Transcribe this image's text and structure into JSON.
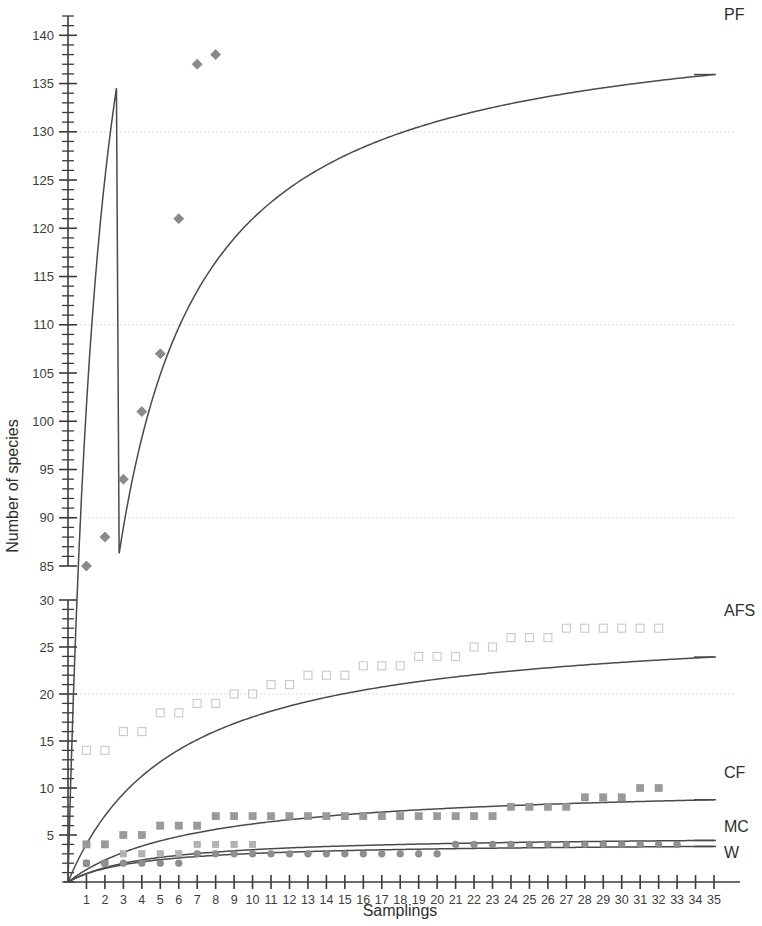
{
  "chart_data": {
    "type": "scatter",
    "title": "",
    "xlabel": "Samplings",
    "ylabel": "Number of species",
    "xlim": [
      0,
      35
    ],
    "xticks": [
      1,
      2,
      3,
      4,
      5,
      6,
      7,
      8,
      9,
      10,
      11,
      12,
      13,
      14,
      15,
      16,
      17,
      18,
      19,
      20,
      21,
      22,
      23,
      24,
      25,
      26,
      27,
      28,
      29,
      30,
      31,
      32,
      33,
      34,
      35
    ],
    "grid": "faint horizontal gridlines at 20, 90, 110, 130",
    "legend_position": "right of plot, at curve ends",
    "y_axis_broken": true,
    "y_axis_break_note": "Axis is broken between 30 and 85; lower segment spans 0-30, upper segment spans 85-140+",
    "y_lower_segment": {
      "range": [
        0,
        30
      ],
      "labeled_ticks": [
        5,
        10,
        15,
        20,
        25,
        30
      ],
      "minor_tick_step": 1
    },
    "y_upper_segment": {
      "range": [
        85,
        142
      ],
      "labeled_ticks": [
        85,
        90,
        95,
        100,
        105,
        110,
        115,
        120,
        125,
        130,
        135,
        140
      ],
      "minor_tick_step": 1
    },
    "series": [
      {
        "name": "PF",
        "label": "PF",
        "marker": "filled-diamond",
        "color": "#8a8a8a",
        "x": [
          1,
          2,
          3,
          4,
          5,
          6,
          7,
          8
        ],
        "values": [
          85,
          88,
          94,
          101,
          107,
          121,
          137,
          138
        ],
        "curve_asymptote": 143,
        "curve_note": "Michaelis-Menten style saturation curve rising from 0 to about 143 at sampling 35"
      },
      {
        "name": "AFS",
        "label": "AFS",
        "marker": "open-square",
        "color": "#c9c9c9",
        "x": [
          1,
          2,
          3,
          4,
          5,
          6,
          7,
          8,
          9,
          10,
          11,
          12,
          13,
          14,
          15,
          16,
          17,
          18,
          19,
          20,
          21,
          22,
          23,
          24,
          25,
          26,
          27,
          28,
          29,
          30,
          31,
          32
        ],
        "values": [
          14,
          14,
          16,
          16,
          18,
          18,
          19,
          19,
          20,
          20,
          21,
          21,
          22,
          22,
          22,
          23,
          23,
          23,
          24,
          24,
          24,
          25,
          25,
          26,
          26,
          26,
          27,
          27,
          27,
          27,
          27,
          27
        ],
        "curve_asymptote": 28,
        "curve_note": "Saturation curve rising to about 28 at sampling 35"
      },
      {
        "name": "CF",
        "label": "CF",
        "marker": "filled-square",
        "color": "#9a9a9a",
        "x": [
          1,
          2,
          3,
          4,
          5,
          6,
          7,
          8,
          9,
          10,
          11,
          12,
          13,
          14,
          15,
          16,
          17,
          18,
          19,
          20,
          21,
          22,
          23,
          24,
          25,
          26,
          27,
          28,
          29,
          30,
          31,
          32
        ],
        "values": [
          4,
          4,
          5,
          5,
          6,
          6,
          6,
          7,
          7,
          7,
          7,
          7,
          7,
          7,
          7,
          7,
          7,
          7,
          7,
          7,
          7,
          7,
          7,
          8,
          8,
          8,
          8,
          9,
          9,
          9,
          10,
          10
        ],
        "curve_asymptote": 10.5,
        "curve_note": "Saturation curve rising to about 10.5 at sampling 35"
      },
      {
        "name": "MC",
        "label": "MC",
        "marker": "filled-square-light",
        "color": "#b3b3b3",
        "x": [
          1,
          2,
          3,
          4,
          5,
          6,
          7,
          8,
          9,
          10
        ],
        "values": [
          2,
          2,
          3,
          3,
          3,
          3,
          4,
          4,
          4,
          4
        ],
        "curve_asymptote": 5,
        "curve_note": "Saturation curve rising to about 5 at sampling 35"
      },
      {
        "name": "W",
        "label": "W",
        "marker": "filled-circle",
        "color": "#8f8f8f",
        "x": [
          1,
          2,
          3,
          4,
          5,
          6,
          7,
          8,
          9,
          10,
          11,
          12,
          13,
          14,
          15,
          16,
          17,
          18,
          19,
          20,
          21,
          22,
          23,
          24,
          25,
          26,
          27,
          28,
          29,
          30,
          31,
          32,
          33
        ],
        "values": [
          2,
          2,
          2,
          2,
          2,
          2,
          3,
          3,
          3,
          3,
          3,
          3,
          3,
          3,
          3,
          3,
          3,
          3,
          3,
          3,
          4,
          4,
          4,
          4,
          4,
          4,
          4,
          4,
          4,
          4,
          4,
          4,
          4
        ],
        "curve_asymptote": 4.2,
        "curve_note": "Saturation curve rising to about 4.2 at sampling 35"
      }
    ]
  }
}
